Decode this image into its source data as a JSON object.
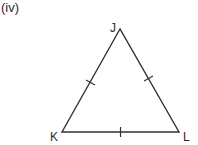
{
  "figure": {
    "label": "(iv)"
  },
  "triangle": {
    "vertices": [
      {
        "name": "J",
        "x": 120,
        "y": 29
      },
      {
        "name": "K",
        "x": 62,
        "y": 132
      },
      {
        "name": "L",
        "x": 179,
        "y": 132
      }
    ],
    "labels": {
      "J": "J",
      "K": "K",
      "L": "L"
    },
    "sides": [
      {
        "name": "JK",
        "tick_marks": 1
      },
      {
        "name": "JL",
        "tick_marks": 1
      },
      {
        "name": "KL",
        "tick_marks": 1
      }
    ],
    "type": "equilateral",
    "stroke_color": "#333333"
  }
}
